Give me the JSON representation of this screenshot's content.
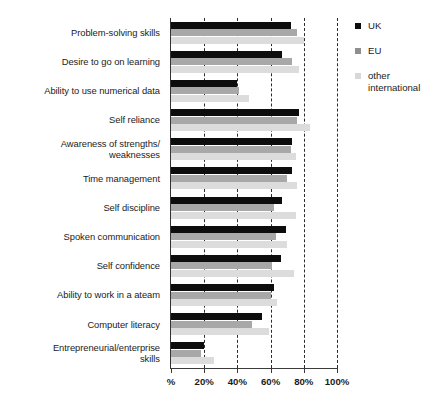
{
  "chart_data": {
    "type": "bar",
    "orientation": "horizontal",
    "title": "",
    "subtitle": "",
    "xlabel": "%",
    "ylabel": "",
    "xlim": [
      0,
      100
    ],
    "grid": true,
    "grid_axis": "x",
    "grid_style": "dashed",
    "legend_position": "right",
    "xticks": [
      0,
      20,
      40,
      60,
      80,
      100
    ],
    "xtick_labels": [
      "%",
      "20%",
      "40%",
      "60%",
      "80%",
      "100%"
    ],
    "categories": [
      "Problem-solving skills",
      "Desire to go on learning",
      "Ability to use numerical data",
      "Self reliance",
      "Awareness of strengths/\nweaknesses",
      "Time management",
      "Self discipline",
      "Spoken communication",
      "Self confidence",
      "Ability to work in a ateam",
      "Computer literacy",
      "Entrepreneurial/enterprise\nskills"
    ],
    "series": [
      {
        "name": "UK",
        "color": "#0d0d0d",
        "values": [
          72,
          67,
          40,
          77,
          73,
          73,
          67,
          69,
          66,
          62,
          55,
          20
        ]
      },
      {
        "name": "EU",
        "color": "#a8a8a8",
        "values": [
          76,
          73,
          41,
          76,
          72,
          70,
          62,
          63,
          61,
          60,
          49,
          18
        ]
      },
      {
        "name": "other\ninternational",
        "color": "#dcdcdc",
        "values": [
          80,
          77,
          47,
          84,
          75,
          76,
          75,
          70,
          74,
          64,
          59,
          26
        ]
      }
    ]
  },
  "legend": {
    "items": [
      {
        "label": "UK",
        "color": "#0d0d0d"
      },
      {
        "label": "EU",
        "color": "#8f8f8f"
      },
      {
        "label": "other\ninternational",
        "color": "#d8d8d8"
      }
    ]
  }
}
